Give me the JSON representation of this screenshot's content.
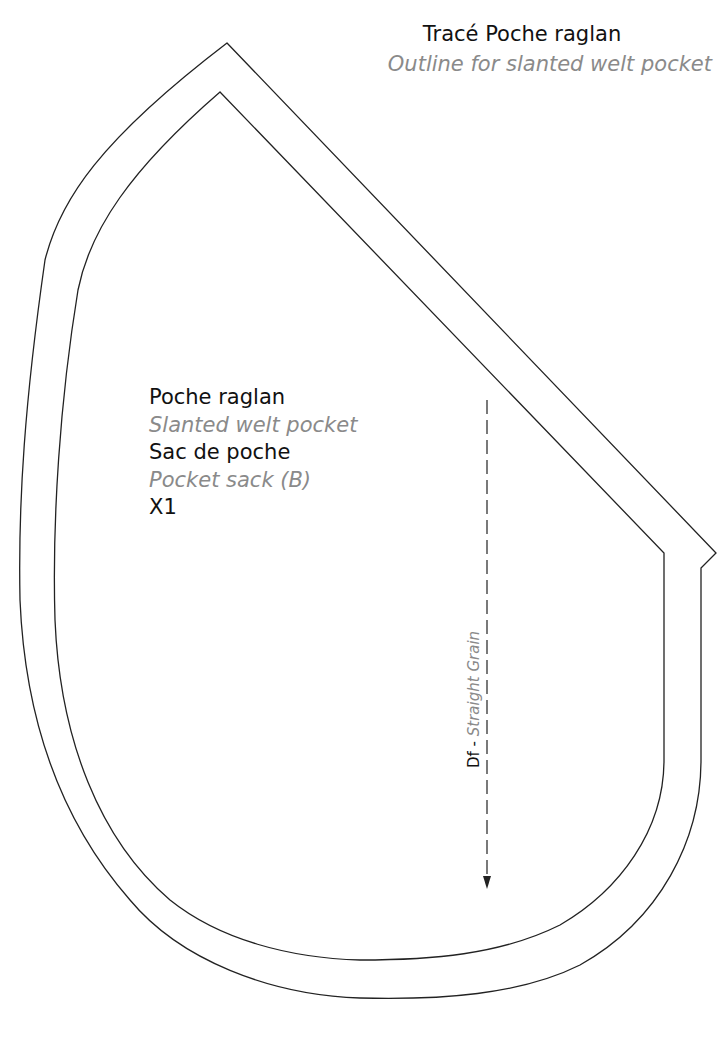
{
  "header": {
    "title_fr": "Tracé Poche raglan",
    "title_en": "Outline for slanted welt pocket"
  },
  "piece_labels": {
    "name_fr": "Poche raglan",
    "name_en": "Slanted welt pocket",
    "part_fr": "Sac de poche",
    "part_en": "Pocket sack (B)",
    "quantity": "X1"
  },
  "grain_line": {
    "label_fr": "Df",
    "separator": " - ",
    "label_en": "Straight Grain",
    "direction": "down"
  },
  "colors": {
    "line": "#222222",
    "text_primary": "#111111",
    "text_secondary": "#8a8a8a",
    "background": "#ffffff"
  }
}
